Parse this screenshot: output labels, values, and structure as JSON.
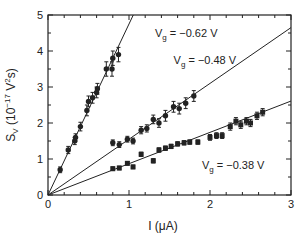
{
  "chart_data": {
    "type": "scatter",
    "title": "",
    "xlabel": "I (μA)",
    "ylabel": "S_V (10^-17 V^2 s)",
    "xlim": [
      0,
      3
    ],
    "ylim": [
      0,
      5
    ],
    "x_ticks": [
      0,
      1,
      2,
      3
    ],
    "y_ticks": [
      0,
      1,
      2,
      3,
      4,
      5
    ],
    "grid": false,
    "legend": "inline annotations",
    "series": [
      {
        "name": "Vg = -0.62 V",
        "label": "V_g = −0.62 V",
        "fit_slope": 4.75,
        "points": [
          {
            "x": 0.15,
            "y": 0.7,
            "err": 0.08
          },
          {
            "x": 0.25,
            "y": 1.25,
            "err": 0.1
          },
          {
            "x": 0.33,
            "y": 1.5,
            "err": 0.1
          },
          {
            "x": 0.34,
            "y": 1.6,
            "err": 0.1
          },
          {
            "x": 0.4,
            "y": 1.9,
            "err": 0.12
          },
          {
            "x": 0.48,
            "y": 2.35,
            "err": 0.15
          },
          {
            "x": 0.5,
            "y": 2.6,
            "err": 0.15
          },
          {
            "x": 0.55,
            "y": 2.7,
            "err": 0.15
          },
          {
            "x": 0.6,
            "y": 2.85,
            "err": 0.15
          },
          {
            "x": 0.61,
            "y": 2.95,
            "err": 0.15
          },
          {
            "x": 0.72,
            "y": 3.5,
            "err": 0.2
          },
          {
            "x": 0.79,
            "y": 3.5,
            "err": 0.2
          },
          {
            "x": 0.8,
            "y": 3.8,
            "err": 0.2
          },
          {
            "x": 0.87,
            "y": 3.9,
            "err": 0.2
          }
        ]
      },
      {
        "name": "Vg = -0.48 V",
        "label": "V_g = −0.48 V",
        "fit_slope": 1.55,
        "points": [
          {
            "x": 0.8,
            "y": 1.45,
            "err": 0.08
          },
          {
            "x": 0.88,
            "y": 1.4,
            "err": 0.08
          },
          {
            "x": 0.98,
            "y": 1.55,
            "err": 0.08
          },
          {
            "x": 1.05,
            "y": 1.5,
            "err": 0.08
          },
          {
            "x": 1.15,
            "y": 1.8,
            "err": 0.1
          },
          {
            "x": 1.22,
            "y": 1.85,
            "err": 0.1
          },
          {
            "x": 1.3,
            "y": 2.1,
            "err": 0.12
          },
          {
            "x": 1.37,
            "y": 2.0,
            "err": 0.12
          },
          {
            "x": 1.45,
            "y": 2.2,
            "err": 0.15
          },
          {
            "x": 1.55,
            "y": 2.45,
            "err": 0.15
          },
          {
            "x": 1.62,
            "y": 2.4,
            "err": 0.15
          },
          {
            "x": 1.7,
            "y": 2.55,
            "err": 0.15
          },
          {
            "x": 1.8,
            "y": 2.75,
            "err": 0.15
          }
        ]
      },
      {
        "name": "Vg = -0.38 V",
        "label": "V_g = −0.38 V",
        "fit_slope": 0.87,
        "points": [
          {
            "x": 0.8,
            "y": 0.73,
            "err": 0.05
          },
          {
            "x": 0.88,
            "y": 0.75,
            "err": 0.05
          },
          {
            "x": 0.98,
            "y": 0.88,
            "err": 0.05
          },
          {
            "x": 1.05,
            "y": 0.78,
            "err": 0.05
          },
          {
            "x": 1.15,
            "y": 1.13,
            "err": 0.06
          },
          {
            "x": 1.3,
            "y": 0.95,
            "err": 0.06
          },
          {
            "x": 1.37,
            "y": 1.25,
            "err": 0.06
          },
          {
            "x": 1.45,
            "y": 1.3,
            "err": 0.06
          },
          {
            "x": 1.52,
            "y": 1.35,
            "err": 0.06
          },
          {
            "x": 1.6,
            "y": 1.42,
            "err": 0.06
          },
          {
            "x": 1.68,
            "y": 1.45,
            "err": 0.06
          },
          {
            "x": 1.75,
            "y": 1.47,
            "err": 0.06
          },
          {
            "x": 1.85,
            "y": 1.47,
            "err": 0.06
          },
          {
            "x": 2.0,
            "y": 1.6,
            "err": 0.08
          },
          {
            "x": 2.08,
            "y": 1.65,
            "err": 0.08
          },
          {
            "x": 2.15,
            "y": 1.65,
            "err": 0.08
          },
          {
            "x": 2.25,
            "y": 1.9,
            "err": 0.1
          },
          {
            "x": 2.32,
            "y": 2.05,
            "err": 0.1
          },
          {
            "x": 2.38,
            "y": 1.95,
            "err": 0.1
          },
          {
            "x": 2.45,
            "y": 2.05,
            "err": 0.1
          },
          {
            "x": 2.5,
            "y": 2.0,
            "err": 0.1
          },
          {
            "x": 2.58,
            "y": 2.2,
            "err": 0.1
          },
          {
            "x": 2.65,
            "y": 2.3,
            "err": 0.1
          }
        ]
      }
    ],
    "annotations": [
      {
        "text_main": "V",
        "text_sub": "g",
        "text_rest": " = −0.62 V",
        "x": 1.32,
        "y": 4.4
      },
      {
        "text_main": "V",
        "text_sub": "g",
        "text_rest": " = −0.48 V",
        "x": 1.55,
        "y": 3.65
      },
      {
        "text_main": "V",
        "text_sub": "g",
        "text_rest": " = −0.38 V",
        "x": 1.9,
        "y": 0.72
      }
    ]
  },
  "labels": {
    "x_axis": "I (μA)",
    "y_axis_main": "S",
    "y_axis_sub": "V",
    "y_axis_rest": " (10",
    "y_axis_exp": "−17",
    "y_axis_rest2": " V",
    "y_axis_exp2": "2",
    "y_axis_rest3": "s)"
  }
}
